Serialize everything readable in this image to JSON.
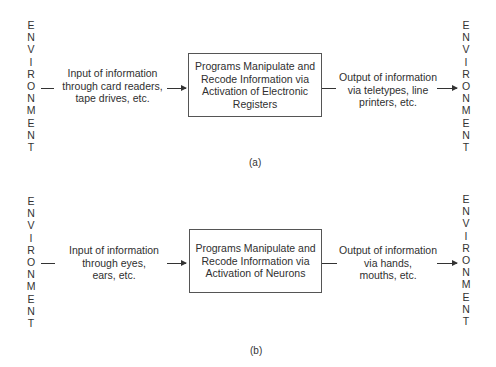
{
  "diagrams": [
    {
      "id": "a",
      "caption": "(a)",
      "left_env": [
        "E",
        "N",
        "V",
        "I",
        "R",
        "O",
        "N",
        "M",
        "E",
        "N",
        "T"
      ],
      "right_env": [
        "E",
        "N",
        "V",
        "I",
        "R",
        "O",
        "N",
        "M",
        "E",
        "N",
        "T"
      ],
      "input": [
        "Input of information",
        "through card readers,",
        "tape drives, etc."
      ],
      "process": [
        "Programs Manipulate and",
        "Recode Information via",
        "Activation of Electronic",
        "Registers"
      ],
      "output": [
        "Output of information",
        "via teletypes, line",
        "printers, etc."
      ]
    },
    {
      "id": "b",
      "caption": "(b)",
      "left_env": [
        "E",
        "N",
        "V",
        "I",
        "R",
        "O",
        "N",
        "M",
        "E",
        "N",
        "T"
      ],
      "right_env": [
        "E",
        "N",
        "V",
        "I",
        "R",
        "O",
        "N",
        "M",
        "E",
        "N",
        "T"
      ],
      "input": [
        "Input of information",
        "through eyes,",
        "ears, etc."
      ],
      "process": [
        "Programs Manipulate and",
        "Recode Information via",
        "Activation of Neurons"
      ],
      "output": [
        "Output of information",
        "via hands,",
        "mouths, etc."
      ]
    }
  ]
}
